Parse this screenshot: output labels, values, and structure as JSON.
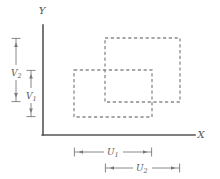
{
  "figure": {
    "width": 220,
    "height": 179,
    "background": "#ffffff",
    "axis_color": "#555555",
    "rect_color": "#8a8a8a",
    "dim_color": "#7a7a7a",
    "label_color": "#555555"
  },
  "axes": {
    "x_label": "X",
    "y_label": "Y",
    "origin": {
      "x": 43,
      "y": 135
    },
    "x_end": 195,
    "y_top": 25
  },
  "rectangles": [
    {
      "name": "rectangle-1",
      "x1": 74,
      "y1": 70,
      "x2": 152,
      "y2": 117,
      "style": "dashed",
      "width_dimension": "U1",
      "height_dimension": "V1"
    },
    {
      "name": "rectangle-2",
      "x1": 105,
      "y1": 38,
      "x2": 180,
      "y2": 102,
      "style": "dashed",
      "width_dimension": "U2",
      "height_dimension": "V2"
    }
  ],
  "dimensions": {
    "vertical": [
      {
        "id": "V2",
        "base": "V",
        "sub": "2",
        "x": 16,
        "y_top": 38,
        "y_bottom": 102,
        "label_x": 11,
        "label_y": 73
      },
      {
        "id": "V1",
        "base": "V",
        "sub": "1",
        "x": 31,
        "y_top": 70,
        "y_bottom": 117,
        "label_x": 26,
        "label_y": 97
      }
    ],
    "horizontal": [
      {
        "id": "U1",
        "base": "U",
        "sub": "1",
        "y": 152,
        "x_left": 74,
        "x_right": 152,
        "label_x": 113,
        "label_y": 155
      },
      {
        "id": "U2",
        "base": "U",
        "sub": "2",
        "y": 168,
        "x_left": 105,
        "x_right": 180,
        "label_x": 142,
        "label_y": 171
      }
    ]
  }
}
